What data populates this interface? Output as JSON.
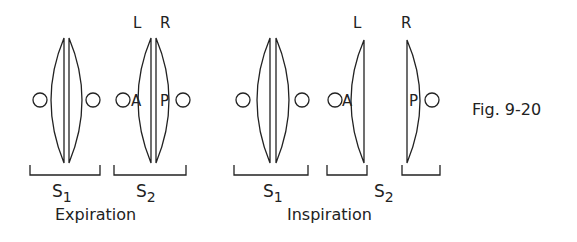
{
  "figure": {
    "caption": "Fig. 9-20",
    "stroke_color": "#222222",
    "background": "#ffffff"
  },
  "panels": [
    {
      "phase_label": "Expiration",
      "groups": [
        {
          "sound": "S",
          "subscript": "1",
          "components": []
        },
        {
          "sound": "S",
          "subscript": "2",
          "components": [
            {
              "side_label": "L",
              "letter": "A"
            },
            {
              "side_label": "R",
              "letter": "P"
            }
          ]
        }
      ]
    },
    {
      "phase_label": "Inspiration",
      "groups": [
        {
          "sound": "S",
          "subscript": "1",
          "components": []
        },
        {
          "sound": "S",
          "subscript": "2",
          "components": [
            {
              "side_label": "L",
              "letter": "A"
            },
            {
              "side_label": "R",
              "letter": "P"
            }
          ]
        }
      ]
    }
  ]
}
